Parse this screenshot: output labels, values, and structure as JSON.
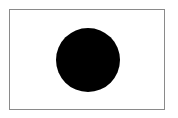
{
  "flag": {
    "background": "#ffffff",
    "border_color": "#8a8a8a",
    "disc": {
      "color": "#000000",
      "center_x": 88,
      "center_y": 60,
      "radius": 32
    }
  }
}
